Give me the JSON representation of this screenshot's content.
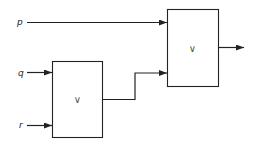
{
  "diagram": {
    "type": "logic-circuit",
    "inputs": [
      {
        "id": "p",
        "label": "p"
      },
      {
        "id": "q",
        "label": "q"
      },
      {
        "id": "r",
        "label": "r"
      }
    ],
    "gates": [
      {
        "id": "gate1",
        "symbol": "∨",
        "operation": "OR",
        "inputs": [
          "q",
          "r"
        ]
      },
      {
        "id": "gate2",
        "symbol": "∨",
        "operation": "OR",
        "inputs": [
          "p",
          "gate1"
        ]
      }
    ],
    "output": {
      "from": "gate2",
      "label": ""
    },
    "colors": {
      "line": "#222222",
      "background": "#ffffff"
    }
  }
}
